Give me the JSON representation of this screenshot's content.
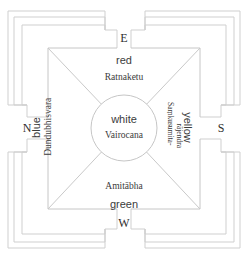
{
  "figure": {
    "type": "mandala-diagram",
    "caption": "",
    "center": {
      "color_label": "white",
      "deity": "Vairocana"
    },
    "directions": [
      {
        "key": "east",
        "letter": "E",
        "position": "top",
        "color_label": "red",
        "deity": "Ratnaketu"
      },
      {
        "key": "south",
        "letter": "S",
        "position": "right",
        "color_label": "yellow",
        "deity": "Saṃkusumita-rājendra",
        "deity_line1": "Saṃkusumita-",
        "deity_line2": "rājendra"
      },
      {
        "key": "west",
        "letter": "W",
        "position": "bottom",
        "color_label": "green",
        "deity": "Amitābha"
      },
      {
        "key": "north",
        "letter": "N",
        "position": "left",
        "color_label": "blue",
        "deity": "Dundubhisvara"
      }
    ],
    "structure": {
      "nested_frames": 4,
      "gates": 4,
      "diagonals": 4,
      "center_shape": "circle"
    },
    "colors": {
      "line": "#cfcfcf",
      "line_dark": "#bdbdbd",
      "text": "#3b3b3b",
      "background": "#ffffff"
    }
  }
}
